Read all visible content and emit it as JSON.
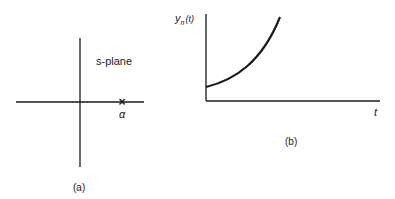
{
  "figure_a": {
    "plane_label": "s-plane",
    "pole_marker": "×",
    "pole_label": "α",
    "caption": "(a)"
  },
  "figure_b": {
    "y_label_main": "y",
    "y_label_sub": "n",
    "y_label_arg": "(t)",
    "x_label": "t",
    "caption": "(b)",
    "curve": "exponentially increasing from positive initial value"
  },
  "colors": {
    "ink": "#1a1a1a",
    "background": "#ffffff"
  }
}
